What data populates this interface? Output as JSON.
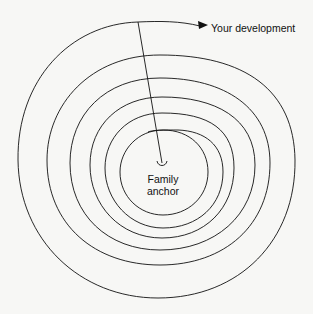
{
  "diagram": {
    "type": "spiral",
    "labels": {
      "outer": "Your development",
      "center_line1": "Family",
      "center_line2": "anchor"
    },
    "colors": {
      "stroke": "#111111",
      "background": "#f7f7f5"
    },
    "rings": 6
  }
}
